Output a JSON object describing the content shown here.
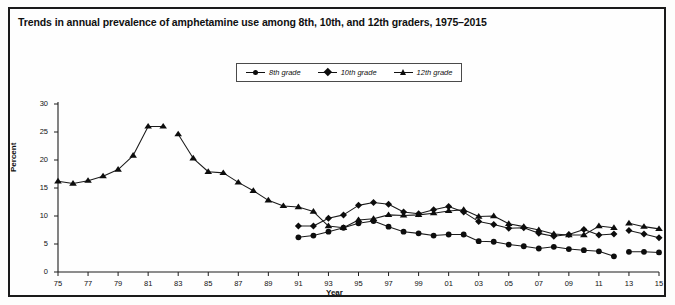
{
  "figure": {
    "title": "Trends in annual prevalence of amphetamine use among 8th, 10th, and 12th graders, 1975–2015",
    "background_color": "#fefefe",
    "frame_color": "#1a1a1a"
  },
  "legend": {
    "position": "top-center",
    "items": [
      {
        "label": "8th grade",
        "marker": "circle",
        "color": "#0d0d0d",
        "icon": "legend-circle-marker-icon"
      },
      {
        "label": "10th grade",
        "marker": "diamond",
        "color": "#0d0d0d",
        "icon": "legend-diamond-marker-icon"
      },
      {
        "label": "12th grade",
        "marker": "triangle",
        "color": "#0d0d0d",
        "icon": "legend-triangle-marker-icon"
      }
    ]
  },
  "axes": {
    "ylabel": "Percent",
    "xlabel": "Year",
    "ylim": [
      0,
      30
    ],
    "yticks": [
      "0",
      "5",
      "10",
      "15",
      "20",
      "25",
      "30"
    ],
    "xlim": [
      1975,
      2015
    ],
    "xticks": [
      "75",
      "77",
      "79",
      "81",
      "83",
      "85",
      "87",
      "89",
      "91",
      "93",
      "95",
      "97",
      "99",
      "01",
      "03",
      "05",
      "07",
      "09",
      "11",
      "13",
      "15"
    ],
    "grid": false
  },
  "chart_data": {
    "type": "line",
    "title": "Trends in annual prevalence of amphetamine use among 8th, 10th, and 12th graders, 1975–2015",
    "xlabel": "Year",
    "ylabel": "Percent",
    "ylim": [
      0,
      30
    ],
    "xlim": [
      1975,
      2015
    ],
    "grid": false,
    "legend_position": "top-center",
    "x": [
      1975,
      1976,
      1977,
      1978,
      1979,
      1980,
      1981,
      1982,
      1983,
      1984,
      1985,
      1986,
      1987,
      1988,
      1989,
      1990,
      1991,
      1992,
      1993,
      1994,
      1995,
      1996,
      1997,
      1998,
      1999,
      2000,
      2001,
      2002,
      2003,
      2004,
      2005,
      2006,
      2007,
      2008,
      2009,
      2010,
      2011,
      2012,
      2013,
      2014,
      2015
    ],
    "series": [
      {
        "name": "8th grade",
        "marker": "circle",
        "values": [
          null,
          null,
          null,
          null,
          null,
          null,
          null,
          null,
          null,
          null,
          null,
          null,
          null,
          null,
          null,
          null,
          6.2,
          6.5,
          7.2,
          7.9,
          8.7,
          9.1,
          8.1,
          7.2,
          6.9,
          6.5,
          6.7,
          6.7,
          5.5,
          5.4,
          4.9,
          4.6,
          4.2,
          4.5,
          4.1,
          3.9,
          3.7,
          2.8,
          3.6,
          3.6,
          3.5
        ]
      },
      {
        "name": "10th grade",
        "marker": "diamond",
        "values": [
          null,
          null,
          null,
          null,
          null,
          null,
          null,
          null,
          null,
          null,
          null,
          null,
          null,
          null,
          null,
          null,
          8.2,
          8.2,
          9.6,
          10.2,
          11.9,
          12.4,
          12.1,
          10.7,
          10.4,
          11.1,
          11.7,
          10.7,
          9.0,
          8.5,
          7.8,
          7.9,
          6.9,
          6.4,
          6.7,
          7.6,
          6.6,
          6.8,
          7.4,
          6.8,
          6.1
        ]
      },
      {
        "name": "12th grade",
        "marker": "triangle",
        "values": [
          16.2,
          15.8,
          16.3,
          17.1,
          18.3,
          20.8,
          26.0,
          26.0,
          24.6,
          20.3,
          17.9,
          17.7,
          16.0,
          14.5,
          12.8,
          11.8,
          11.6,
          10.8,
          8.2,
          7.9,
          9.3,
          9.5,
          10.2,
          10.1,
          10.2,
          10.5,
          10.9,
          11.1,
          9.9,
          10.0,
          8.6,
          8.1,
          7.5,
          6.8,
          6.6,
          6.6,
          8.2,
          7.9,
          8.7,
          8.1,
          7.7
        ]
      }
    ],
    "notes": [
      "12th grade series is plotted as two segments with a break after 1982 (question wording revision).",
      "All series are plotted as two segments with a break after 2012."
    ]
  }
}
